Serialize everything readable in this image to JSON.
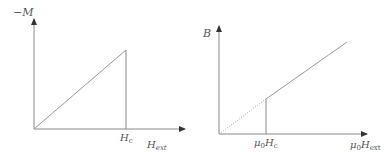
{
  "diagrams": [
    {
      "id": "left",
      "description": "Magnetization vs external field for a type-I superconductor",
      "y_label": "−M",
      "x_label_main": "H",
      "x_label_sub": "ext",
      "tick_label_main": "H",
      "tick_label_sub": "c",
      "curve": "linear rise from origin to H_c, then vertical drop to zero"
    },
    {
      "id": "right",
      "description": "Magnetic field B inside vs applied field",
      "y_label": "B",
      "x_label_prefix": "μ",
      "x_label_prefix_sub": "0",
      "x_label_main": "H",
      "x_label_sub": "ext",
      "tick_label_prefix": "μ",
      "tick_label_prefix_sub": "0",
      "tick_label_main": "H",
      "tick_label_sub": "c",
      "curve": "zero (dotted reference line) below μ0Hc, linear B = μ0H above"
    }
  ],
  "colors": {
    "line": "#777777",
    "text": "#555555"
  }
}
